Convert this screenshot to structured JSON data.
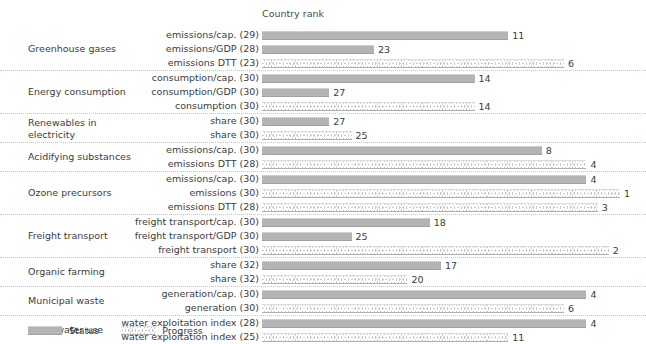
{
  "chart_data": {
    "type": "bar",
    "title": "",
    "xlabel": "Country rank",
    "ylabel": "",
    "orientation": "horizontal",
    "xlim": [
      33,
      0
    ],
    "note": "Bar length is inverse to rank: rank 1 is the longest bar, higher rank numbers give shorter bars.",
    "grid": false,
    "legend_position": "bottom-left",
    "legend": [
      {
        "name": "Status",
        "series_key": "status",
        "color": "#b4b4b4"
      },
      {
        "name": "Progress",
        "series_key": "progress",
        "color": "#c9c9c9"
      }
    ],
    "groups": [
      {
        "group": "Greenhouse gases",
        "rows": [
          {
            "label": "emissions/cap. (29)",
            "value": 11,
            "series": "status"
          },
          {
            "label": "emissions/GDP (28)",
            "value": 23,
            "series": "status"
          },
          {
            "label": "emissions DTT (23)",
            "value": 6,
            "series": "progress"
          }
        ]
      },
      {
        "group": "Energy consumption",
        "rows": [
          {
            "label": "consumption/cap. (30)",
            "value": 14,
            "series": "status"
          },
          {
            "label": "consumption/GDP (30)",
            "value": 27,
            "series": "status"
          },
          {
            "label": "consumption (30)",
            "value": 14,
            "series": "progress"
          }
        ]
      },
      {
        "group": "Renewables in electricity",
        "rows": [
          {
            "label": "share (30)",
            "value": 27,
            "series": "status"
          },
          {
            "label": "share (30)",
            "value": 25,
            "series": "progress"
          }
        ]
      },
      {
        "group": "Acidifying substances",
        "rows": [
          {
            "label": "emissions/cap. (30)",
            "value": 8,
            "series": "status"
          },
          {
            "label": "emissions DTT (28)",
            "value": 4,
            "series": "progress"
          }
        ]
      },
      {
        "group": "Ozone precursors",
        "rows": [
          {
            "label": "emissions/cap. (30)",
            "value": 4,
            "series": "status"
          },
          {
            "label": "emissions (30)",
            "value": 1,
            "series": "progress"
          },
          {
            "label": "emissions DTT (28)",
            "value": 3,
            "series": "progress"
          }
        ]
      },
      {
        "group": "Freight transport",
        "rows": [
          {
            "label": "freight transport/cap. (30)",
            "value": 18,
            "series": "status"
          },
          {
            "label": "freight transport/GDP (30)",
            "value": 25,
            "series": "status"
          },
          {
            "label": "freight transport (30)",
            "value": 2,
            "series": "progress"
          }
        ]
      },
      {
        "group": "Organic farming",
        "rows": [
          {
            "label": "share (32)",
            "value": 17,
            "series": "status"
          },
          {
            "label": "share (32)",
            "value": 20,
            "series": "progress"
          }
        ]
      },
      {
        "group": "Municipal waste",
        "rows": [
          {
            "label": "generation/cap. (30)",
            "value": 4,
            "series": "status"
          },
          {
            "label": "generation (30)",
            "value": 6,
            "series": "progress"
          }
        ]
      },
      {
        "group": "Fresh water use",
        "rows": [
          {
            "label": "water exploitation index (28)",
            "value": 4,
            "series": "status"
          },
          {
            "label": "water exploitation index (25)",
            "value": 11,
            "series": "progress"
          }
        ]
      }
    ]
  }
}
